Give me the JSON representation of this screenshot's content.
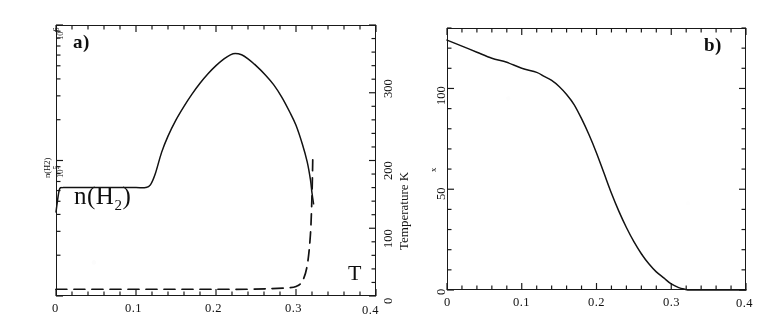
{
  "figure": {
    "panels": [
      {
        "tag": "a)",
        "x_axis": {
          "ticks": [
            "0",
            "0.1",
            "0.2",
            "0.3",
            "0.4"
          ],
          "values": [
            0,
            0.1,
            0.2,
            0.3,
            0.4
          ],
          "min": 0,
          "max": 0.4,
          "minor_per_major": 5
        },
        "left_axis": {
          "label_main": "n(H2)",
          "ticks": [
            "10",
            "10"
          ],
          "exponents": [
            "6",
            "5"
          ],
          "type": "log",
          "min_exp": 4,
          "max_exp": 6
        },
        "right_axis": {
          "title": "Temperature  K",
          "ticks": [
            "300",
            "200",
            "100",
            "0"
          ],
          "values": [
            300,
            200,
            100,
            0
          ],
          "min": 0,
          "max": 400
        },
        "series_labels": {
          "density": "n(H",
          "density_sub": "2",
          "density_close": ")",
          "temperature": "T"
        }
      },
      {
        "tag": "b)",
        "x_axis": {
          "ticks": [
            "0",
            "0.1",
            "0.2",
            "0.3",
            "0.4"
          ],
          "values": [
            0,
            0.1,
            0.2,
            0.3,
            0.4
          ],
          "min": 0,
          "max": 0.4,
          "minor_per_major": 5
        },
        "y_axis": {
          "title": "x",
          "ticks": [
            "100",
            "50",
            "0"
          ],
          "values": [
            100,
            50,
            0
          ],
          "min": 0,
          "max": 130
        }
      }
    ]
  },
  "chart_data": [
    {
      "type": "line",
      "panel": "a)",
      "title": "",
      "xlabel": "",
      "ylabel": "n(H2)",
      "y2label": "Temperature  K",
      "xlim": [
        0,
        0.4
      ],
      "ylim_left_log10": [
        4.0,
        6.0
      ],
      "ylim_right": [
        0,
        400
      ],
      "grid": false,
      "legend": "inline annotations",
      "xticks": [
        0,
        0.1,
        0.2,
        0.3,
        0.4
      ],
      "yticks_left_log10": [
        5,
        6
      ],
      "yticks_right": [
        0,
        100,
        200,
        300
      ],
      "series": [
        {
          "name": "n(H2)",
          "style": "solid",
          "units": "cm^-3",
          "x": [
            0.0,
            0.004,
            0.008,
            0.012,
            0.02,
            0.04,
            0.06,
            0.08,
            0.1,
            0.112,
            0.118,
            0.124,
            0.132,
            0.14,
            0.15,
            0.16,
            0.17,
            0.18,
            0.19,
            0.2,
            0.21,
            0.218,
            0.224,
            0.232,
            0.24,
            0.25,
            0.262,
            0.272,
            0.282,
            0.292,
            0.3,
            0.308,
            0.314,
            0.318,
            0.32,
            0.322
          ],
          "y_log10": [
            4.62,
            4.78,
            4.8,
            4.8,
            4.8,
            4.8,
            4.8,
            4.8,
            4.8,
            4.8,
            4.82,
            4.9,
            5.06,
            5.18,
            5.3,
            5.4,
            5.49,
            5.57,
            5.64,
            5.7,
            5.75,
            5.78,
            5.79,
            5.78,
            5.75,
            5.7,
            5.63,
            5.56,
            5.47,
            5.36,
            5.26,
            5.12,
            4.99,
            4.86,
            4.76,
            4.68
          ]
        },
        {
          "name": "T",
          "style": "dashed",
          "units": "K",
          "x": [
            0.0,
            0.01,
            0.04,
            0.08,
            0.12,
            0.16,
            0.2,
            0.24,
            0.27,
            0.29,
            0.3,
            0.308,
            0.314,
            0.318,
            0.32,
            0.321
          ],
          "y_right": [
            10,
            10,
            10,
            10,
            10,
            10,
            10,
            10,
            11,
            12,
            14,
            22,
            45,
            90,
            150,
            205
          ]
        }
      ],
      "annotations": [
        {
          "text": "n(H2)",
          "x": 0.045,
          "y_log10": 5.12
        },
        {
          "text": "T",
          "x": 0.345,
          "y_right": 18
        },
        {
          "text": "a)",
          "x": 0.022,
          "y_log10": 5.92
        }
      ]
    },
    {
      "type": "line",
      "panel": "b)",
      "title": "",
      "xlabel": "",
      "ylabel": "x",
      "xlim": [
        0,
        0.4
      ],
      "ylim": [
        0,
        130
      ],
      "grid": false,
      "xticks": [
        0,
        0.1,
        0.2,
        0.3,
        0.4
      ],
      "yticks": [
        0,
        50,
        100
      ],
      "series": [
        {
          "name": "x",
          "style": "solid",
          "x": [
            0.0,
            0.02,
            0.04,
            0.06,
            0.08,
            0.1,
            0.12,
            0.13,
            0.14,
            0.15,
            0.16,
            0.17,
            0.18,
            0.19,
            0.2,
            0.21,
            0.22,
            0.23,
            0.24,
            0.25,
            0.26,
            0.27,
            0.28,
            0.29,
            0.3,
            0.31,
            0.318,
            0.325,
            0.34,
            0.4
          ],
          "y": [
            124,
            121,
            118,
            115,
            113,
            110,
            108,
            106,
            104,
            101,
            97,
            92,
            85,
            77,
            68,
            58,
            48,
            39,
            31,
            24,
            18,
            13,
            9,
            6,
            3,
            1.2,
            0.4,
            0.0,
            0.0,
            0.0
          ]
        }
      ],
      "annotations": [
        {
          "text": "b)",
          "x": 0.345,
          "y": 122
        }
      ]
    }
  ]
}
